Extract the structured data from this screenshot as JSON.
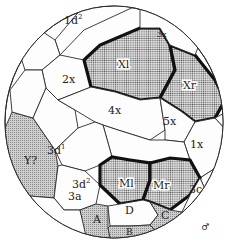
{
  "diagram": {
    "type": "cell-lineage-fate-map",
    "cells": [
      {
        "id": "1d2",
        "label": "1d",
        "sup": "2",
        "shading": "none"
      },
      {
        "id": "3x",
        "label": "3x",
        "shading": "none"
      },
      {
        "id": "2x",
        "label": "2x",
        "shading": "none"
      },
      {
        "id": "Xl",
        "label": "Xl",
        "shading": "stippled-outlined"
      },
      {
        "id": "Xr",
        "label": "Xr",
        "shading": "stippled-outlined"
      },
      {
        "id": "4x",
        "label": "4x",
        "shading": "none"
      },
      {
        "id": "5x",
        "label": "5x",
        "shading": "none"
      },
      {
        "id": "3d1",
        "label": "3d",
        "sup": "1",
        "shading": "none"
      },
      {
        "id": "Y",
        "label": "Y?",
        "shading": "grey"
      },
      {
        "id": "3d2",
        "label": "3d",
        "sup": "2",
        "shading": "none"
      },
      {
        "id": "1x",
        "label": "1x",
        "shading": "none"
      },
      {
        "id": "Ml",
        "label": "Ml",
        "shading": "stippled-outlined"
      },
      {
        "id": "Mr",
        "label": "Mr",
        "shading": "stippled-outlined"
      },
      {
        "id": "3c",
        "label": "3c",
        "shading": "none"
      },
      {
        "id": "3a",
        "label": "3a",
        "shading": "none"
      },
      {
        "id": "A",
        "label": "A",
        "shading": "grey"
      },
      {
        "id": "D",
        "label": "D",
        "shading": "none"
      },
      {
        "id": "C",
        "label": "C",
        "shading": "grey"
      },
      {
        "id": "B",
        "label": "B",
        "shading": "grey"
      }
    ],
    "symbol": "♂"
  },
  "colors": {
    "outline": "#2a2a2a",
    "thick_outline": "#111111",
    "stipple_fill": "#c8c8c8",
    "grey_fill": "#bdbdbd",
    "background": "#ffffff"
  }
}
